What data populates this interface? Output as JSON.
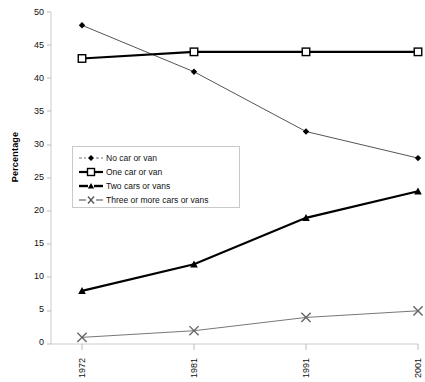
{
  "chart_data": {
    "type": "line",
    "title": "",
    "subtitle": "",
    "xlabel": "",
    "ylabel": "Percentage",
    "categories": [
      "1972",
      "1981",
      "1991",
      "2001"
    ],
    "x": [
      1972,
      1981,
      1991,
      2001
    ],
    "xlim": [
      1972,
      2001
    ],
    "ylim": [
      0,
      50
    ],
    "yticks": [
      0,
      5,
      10,
      15,
      20,
      25,
      30,
      35,
      40,
      45,
      50
    ],
    "ytick_labels": [
      "0",
      "5",
      "10",
      "15",
      "20",
      "25",
      "30",
      "35",
      "40",
      "45",
      "50"
    ],
    "grid": false,
    "legend_position": "center-left-inside",
    "series": [
      {
        "name": "No car or van",
        "values": [
          48,
          41,
          32,
          28
        ],
        "marker": "diamond",
        "color": "#000000",
        "line_color": "#555555",
        "line_width": 1
      },
      {
        "name": "One car or van",
        "values": [
          43,
          44,
          44,
          44
        ],
        "marker": "square",
        "color": "#ffffff",
        "line_color": "#000000",
        "line_width": 2.2
      },
      {
        "name": "Two cars or vans",
        "values": [
          8,
          12,
          19,
          23
        ],
        "marker": "triangle",
        "color": "#000000",
        "line_color": "#000000",
        "line_width": 2.2
      },
      {
        "name": "Three or more cars or vans",
        "values": [
          1,
          2,
          4,
          5
        ],
        "marker": "x",
        "color": "#666666",
        "line_color": "#777777",
        "line_width": 1
      }
    ]
  },
  "axes": {
    "y_axis_label": "Percentage",
    "axis_color": "#cccccc",
    "tick_color": "#bbbbbb"
  },
  "legend": {
    "items": [
      {
        "label": "No car or van"
      },
      {
        "label": "One car or van"
      },
      {
        "label": "Two cars or vans"
      },
      {
        "label": "Three or more cars or vans"
      }
    ]
  }
}
